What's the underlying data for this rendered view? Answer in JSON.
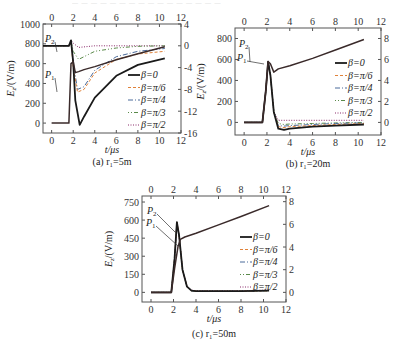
{
  "figure": {
    "top_text": "— — — — — — — — — — — — — — — —",
    "series_styles": [
      {
        "name": "β=0",
        "color": "#1a1a1a",
        "dash": "",
        "width": 1.8
      },
      {
        "name": "β=π/6",
        "color": "#e0823a",
        "dash": "3,2",
        "width": 1
      },
      {
        "name": "β=π/4",
        "color": "#4a6a9a",
        "dash": "5,2,1,2",
        "width": 1
      },
      {
        "name": "β=π/3",
        "color": "#5a8a4a",
        "dash": "1,2,1,2,4,2",
        "width": 1
      },
      {
        "name": "β=π/2",
        "color": "#8a2a6a",
        "dash": "1,1.5",
        "width": 1
      }
    ]
  },
  "chart_data": [
    {
      "id": "a",
      "type": "line",
      "caption": "(a) r₁=5m",
      "xlabel": "t/μs",
      "ylabel": "E_z/(V/m)",
      "x_ticks": [
        "0",
        "2",
        "4",
        "6",
        "8",
        "10",
        "12"
      ],
      "y_ticks_left": [
        "0",
        "200",
        "400",
        "600",
        "800",
        "1000"
      ],
      "y_ticks_right": [
        "-16",
        "-12",
        "-8",
        "-4",
        "0",
        "4"
      ],
      "xlim": [
        -0.8,
        12
      ],
      "ylim_left": [
        -100,
        1000
      ],
      "ylim_right": [
        -16,
        4
      ],
      "annotations": [
        "P2",
        "P1"
      ],
      "legend": [
        "β=0",
        "β=π/6",
        "β=π/4",
        "β=π/3",
        "β=π/2"
      ],
      "series_left": [
        {
          "name": "β=0 (Ez)",
          "x": [
            0,
            1.6,
            1.8,
            2.0,
            2.2,
            2.5,
            3,
            4,
            6,
            8,
            10.5
          ],
          "y": [
            0,
            0,
            600,
            620,
            510,
            520,
            540,
            570,
            640,
            700,
            770
          ]
        }
      ],
      "series_right": [
        {
          "name": "β=0",
          "x": [
            -0.8,
            1.6,
            1.8,
            2.0,
            2.2,
            2.6,
            3,
            4,
            6,
            8,
            10.5
          ],
          "y": [
            0,
            0,
            1,
            -3,
            -10,
            -14.5,
            -13,
            -9.5,
            -5.5,
            -3.5,
            -2.3
          ]
        },
        {
          "name": "β=π/6",
          "x": [
            -0.8,
            1.6,
            1.8,
            2.0,
            2.4,
            3,
            4,
            6,
            8,
            10.5
          ],
          "y": [
            0,
            0,
            1,
            -4,
            -8.5,
            -8,
            -5,
            -2.5,
            -1.5,
            -1
          ]
        },
        {
          "name": "β=π/4",
          "x": [
            -0.8,
            1.6,
            1.8,
            2.0,
            2.4,
            3,
            4,
            6,
            8,
            10.5
          ],
          "y": [
            0,
            0,
            1,
            -3,
            -8,
            -7.5,
            -4.5,
            -2,
            -1,
            -0.5
          ]
        },
        {
          "name": "β=π/3",
          "x": [
            -0.8,
            1.6,
            1.8,
            2.0,
            2.5,
            3,
            4,
            6,
            8,
            10.5
          ],
          "y": [
            0,
            0,
            1,
            -1,
            -2.5,
            -2,
            -1,
            -0.4,
            -0.1,
            0
          ]
        },
        {
          "name": "β=π/2",
          "x": [
            -0.8,
            1.6,
            1.8,
            2.0,
            2.5,
            3,
            4,
            6,
            8,
            10.5
          ],
          "y": [
            0,
            0,
            1,
            0.5,
            -0.3,
            -0.2,
            0,
            0,
            0,
            0
          ]
        }
      ]
    },
    {
      "id": "b",
      "type": "line",
      "caption": "(b) r₁=20m",
      "xlabel": "t/μs",
      "ylabel": "E_z/(V/m)",
      "x_ticks": [
        "0",
        "2",
        "4",
        "6",
        "8",
        "10",
        "12"
      ],
      "y_ticks_left": [
        "0",
        "200",
        "400",
        "600",
        "800"
      ],
      "y_ticks_right": [
        "0",
        "2",
        "4",
        "6",
        "8"
      ],
      "xlim": [
        -0.8,
        12
      ],
      "ylim_left": [
        -120,
        900
      ],
      "ylim_right": [
        -1.2,
        9
      ],
      "annotations": [
        "P2",
        "P1"
      ],
      "legend": [
        "β=0",
        "β=π/6",
        "β=π/4",
        "β=π/3",
        "β=π/2"
      ],
      "series_left": [
        {
          "name": "β=0 (Ez)",
          "x": [
            0,
            1.6,
            1.9,
            2.1,
            2.3,
            2.6,
            3,
            4,
            6,
            8,
            10.5
          ],
          "y": [
            0,
            0,
            300,
            580,
            560,
            480,
            510,
            540,
            610,
            690,
            790
          ]
        }
      ],
      "series_right": [
        {
          "name": "β=0",
          "x": [
            0,
            1.6,
            1.9,
            2.1,
            2.3,
            2.6,
            3,
            3.5,
            4,
            6,
            8,
            10.5
          ],
          "y": [
            0,
            0,
            3,
            5.8,
            4.5,
            1,
            -0.6,
            -0.7,
            -0.6,
            -0.4,
            -0.3,
            -0.2
          ]
        },
        {
          "name": "β=π/6",
          "x": [
            0,
            1.6,
            1.9,
            2.1,
            2.3,
            2.6,
            3,
            3.5,
            4,
            6,
            8,
            10.5
          ],
          "y": [
            0,
            0,
            3,
            5.8,
            4.5,
            1,
            -0.4,
            -0.5,
            -0.4,
            -0.3,
            -0.2,
            -0.1
          ]
        },
        {
          "name": "β=π/4",
          "x": [
            0,
            1.6,
            1.9,
            2.1,
            2.3,
            2.6,
            3,
            3.5,
            4,
            6,
            8,
            10.5
          ],
          "y": [
            0,
            0,
            3,
            5.8,
            4.5,
            1,
            -0.3,
            -0.35,
            -0.3,
            -0.2,
            -0.1,
            -0.05
          ]
        },
        {
          "name": "β=π/3",
          "x": [
            0,
            1.6,
            1.9,
            2.1,
            2.3,
            2.6,
            3,
            3.5,
            4,
            6,
            8,
            10.5
          ],
          "y": [
            0,
            0,
            3,
            5.8,
            4.5,
            1,
            -0.1,
            -0.2,
            -0.15,
            -0.1,
            -0.05,
            0
          ]
        },
        {
          "name": "β=π/2",
          "x": [
            0,
            1.6,
            1.9,
            2.1,
            2.3,
            2.6,
            3,
            3.5,
            4,
            6,
            8,
            10.5
          ],
          "y": [
            0,
            0,
            3,
            5.8,
            4.5,
            1,
            0.2,
            0.2,
            0.2,
            0.2,
            0.2,
            0.2
          ]
        }
      ]
    },
    {
      "id": "c",
      "type": "line",
      "caption": "(c) r₁=50m",
      "xlabel": "t/μs",
      "ylabel": "E_z/(V/m)",
      "x_ticks": [
        "0",
        "2",
        "4",
        "6",
        "8",
        "10",
        "12"
      ],
      "y_ticks_left": [
        "0",
        "150",
        "300",
        "450",
        "600",
        "750"
      ],
      "y_ticks_right": [
        "0",
        "2",
        "4",
        "6",
        "8"
      ],
      "xlim": [
        -0.8,
        12
      ],
      "ylim_left": [
        -80,
        800
      ],
      "ylim_right": [
        -0.85,
        8.5
      ],
      "annotations": [
        "P2",
        "P1"
      ],
      "legend": [
        "β=0",
        "β=π/6",
        "β=π/4",
        "β=π/3",
        "β=π/2"
      ],
      "series_left": [
        {
          "name": "β=0 (Ez)",
          "x": [
            0,
            1.8,
            2.1,
            2.4,
            2.6,
            3,
            4,
            6,
            8,
            10.5
          ],
          "y": [
            0,
            0,
            200,
            380,
            440,
            460,
            490,
            560,
            630,
            720
          ]
        }
      ],
      "series_right": [
        {
          "name": "β=0",
          "x": [
            0,
            1.8,
            2.1,
            2.3,
            2.5,
            2.8,
            3.2,
            3.6,
            4,
            6,
            8,
            10.5
          ],
          "y": [
            0,
            0,
            3,
            6.2,
            5,
            2,
            0.5,
            0.15,
            0.1,
            0.1,
            0.1,
            0.15
          ]
        },
        {
          "name": "β=π/6",
          "x": [
            0,
            1.8,
            2.1,
            2.3,
            2.5,
            2.8,
            3.2,
            3.6,
            4,
            6,
            8,
            10.5
          ],
          "y": [
            0,
            0,
            3,
            6.2,
            5,
            2,
            0.5,
            0.15,
            0.1,
            0.1,
            0.1,
            0.15
          ]
        },
        {
          "name": "β=π/4",
          "x": [
            0,
            1.8,
            2.1,
            2.3,
            2.5,
            2.8,
            3.2,
            3.6,
            4,
            6,
            8,
            10.5
          ],
          "y": [
            0,
            0,
            3,
            6.2,
            5,
            2,
            0.5,
            0.15,
            0.1,
            0.1,
            0.1,
            0.15
          ]
        },
        {
          "name": "β=π/3",
          "x": [
            0,
            1.8,
            2.1,
            2.3,
            2.5,
            2.8,
            3.2,
            3.6,
            4,
            6,
            8,
            10.5
          ],
          "y": [
            0,
            0,
            3,
            6.2,
            5,
            2,
            0.5,
            0.15,
            0.1,
            0.1,
            0.1,
            0.15
          ]
        },
        {
          "name": "β=π/2",
          "x": [
            0,
            1.8,
            2.1,
            2.3,
            2.5,
            2.8,
            3.2,
            3.6,
            4,
            6,
            8,
            10.5
          ],
          "y": [
            0,
            0,
            3,
            6.2,
            5,
            2,
            0.5,
            0.2,
            0.15,
            0.15,
            0.15,
            0.2
          ]
        }
      ]
    }
  ]
}
